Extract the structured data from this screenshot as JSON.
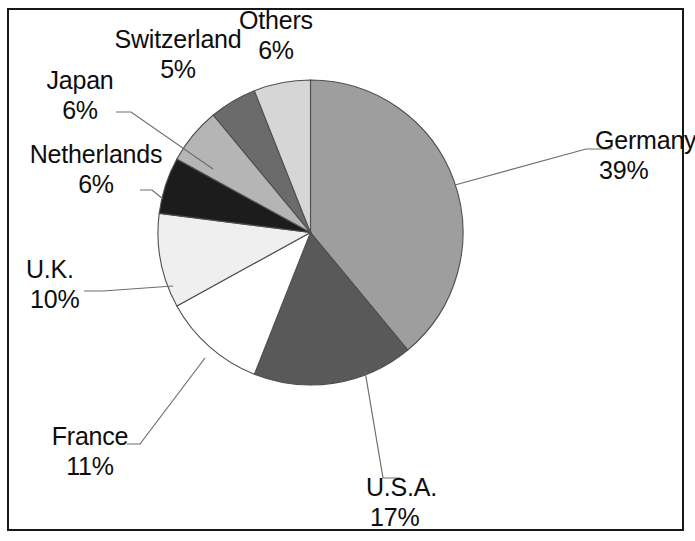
{
  "chart_data": {
    "type": "pie",
    "title": "",
    "subtitle": "",
    "xlabel": "",
    "ylabel": "",
    "legend_position": "none",
    "grid": false,
    "units": "percent",
    "start_angle_deg": 0,
    "direction": "clockwise",
    "categories": [
      "Germany",
      "U.S.A.",
      "France",
      "U.K.",
      "Netherlands",
      "Japan",
      "Switzerland",
      "Others"
    ],
    "values": [
      39,
      17,
      11,
      10,
      6,
      6,
      5,
      6
    ],
    "slices": [
      {
        "label": "Germany",
        "percent_text": "39%",
        "value": 39,
        "color": "#9e9e9e"
      },
      {
        "label": "U.S.A.",
        "percent_text": "17%",
        "value": 17,
        "color": "#595959"
      },
      {
        "label": "France",
        "percent_text": "11%",
        "value": 11,
        "color": "#ffffff"
      },
      {
        "label": "U.K.",
        "percent_text": "10%",
        "value": 10,
        "color": "#efefef"
      },
      {
        "label": "Netherlands",
        "percent_text": "6%",
        "value": 6,
        "color": "#1c1c1c"
      },
      {
        "label": "Japan",
        "percent_text": "6%",
        "value": 6,
        "color": "#b5b5b5"
      },
      {
        "label": "Switzerland",
        "percent_text": "5%",
        "value": 5,
        "color": "#6b6b6b"
      },
      {
        "label": "Others",
        "percent_text": "6%",
        "value": 6,
        "color": "#d6d6d6"
      }
    ],
    "colors": {
      "outline": "#4f4f4f",
      "leader_line": "#6e6e6e",
      "frame": "#18181a",
      "background": "#ffffff",
      "text": "#0d0d0d"
    }
  },
  "labels": {
    "germany": {
      "name": "Germany",
      "pct": "39%"
    },
    "usa": {
      "name": "U.S.A.",
      "pct": "17%"
    },
    "france": {
      "name": "France",
      "pct": "11%"
    },
    "uk": {
      "name": "U.K.",
      "pct": "10%"
    },
    "netherlands": {
      "name": "Netherlands",
      "pct": "6%"
    },
    "japan": {
      "name": "Japan",
      "pct": "6%"
    },
    "switzerland": {
      "name": "Switzerland",
      "pct": "5%"
    },
    "others": {
      "name": "Others",
      "pct": "6%"
    }
  }
}
